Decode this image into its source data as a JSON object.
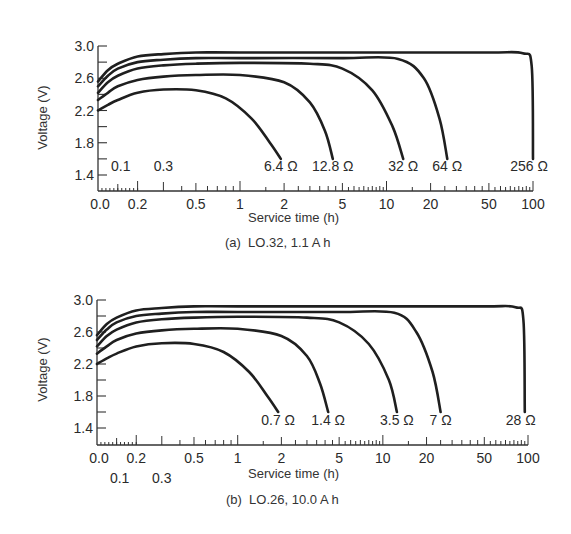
{
  "chart_data": [
    {
      "type": "line",
      "panel": "a",
      "caption": "(a)  LO.32, 1.1 A h",
      "xlabel": "Service time (h)",
      "ylabel": "Voltage (V)",
      "x_scale": "composite (linear 0–0.2, log 0.2–100)",
      "xlim": [
        0.0,
        100
      ],
      "ylim": [
        1.2,
        3.0
      ],
      "y_ticks": [
        3.0,
        2.6,
        2.2,
        1.8,
        1.4
      ],
      "y_tick_labels": [
        "3.0",
        "2.6",
        "2.2",
        "1.8",
        "1.4"
      ],
      "x_tick_labels": [
        "0.0",
        "0.2",
        "0.5",
        "1",
        "2",
        "5",
        "10",
        "20",
        "50",
        "100"
      ],
      "x_extra_labels": [
        "0.1",
        "0.3"
      ],
      "x_extra_labels_position": "inside-plot",
      "grid": false,
      "legend": "curve-end labels",
      "series": [
        {
          "name": "6.4 Ω",
          "x": [
            0.0,
            0.05,
            0.1,
            0.2,
            0.3,
            0.5,
            0.8,
            1.2,
            1.6,
            1.9
          ],
          "y": [
            2.2,
            2.27,
            2.33,
            2.42,
            2.46,
            2.45,
            2.35,
            2.1,
            1.8,
            1.6
          ]
        },
        {
          "name": "12.8 Ω",
          "x": [
            0.0,
            0.05,
            0.1,
            0.2,
            0.3,
            0.5,
            1.0,
            2.0,
            3.0,
            3.8,
            4.3
          ],
          "y": [
            2.33,
            2.42,
            2.5,
            2.58,
            2.62,
            2.64,
            2.64,
            2.55,
            2.3,
            1.95,
            1.6
          ]
        },
        {
          "name": "32 Ω",
          "x": [
            0.0,
            0.05,
            0.1,
            0.2,
            0.3,
            0.5,
            1.0,
            3.0,
            5.0,
            8.0,
            11.0,
            13.0
          ],
          "y": [
            2.42,
            2.55,
            2.63,
            2.72,
            2.76,
            2.78,
            2.79,
            2.78,
            2.72,
            2.45,
            2.0,
            1.6
          ]
        },
        {
          "name": "64 Ω",
          "x": [
            0.0,
            0.05,
            0.1,
            0.2,
            0.3,
            0.5,
            1.0,
            5.0,
            12.0,
            18.0,
            23.0,
            26.0
          ],
          "y": [
            2.5,
            2.63,
            2.72,
            2.8,
            2.83,
            2.85,
            2.85,
            2.85,
            2.84,
            2.6,
            2.1,
            1.6
          ]
        },
        {
          "name": "256 Ω",
          "x": [
            0.0,
            0.05,
            0.1,
            0.2,
            0.3,
            0.5,
            1.0,
            10.0,
            50.0,
            85.0,
            98.0,
            100.0
          ],
          "y": [
            2.56,
            2.7,
            2.78,
            2.87,
            2.9,
            2.92,
            2.92,
            2.92,
            2.92,
            2.91,
            2.75,
            1.6
          ]
        }
      ]
    },
    {
      "type": "line",
      "panel": "b",
      "caption": "(b)  LO.26, 10.0 A h",
      "xlabel": "Service time (h)",
      "ylabel": "Voltage (V)",
      "x_scale": "composite (linear 0–0.2, log 0.2–100)",
      "xlim": [
        0.0,
        100
      ],
      "ylim": [
        1.2,
        3.0
      ],
      "y_ticks": [
        3.0,
        2.6,
        2.2,
        1.8,
        1.4
      ],
      "y_tick_labels": [
        "3.0",
        "2.6",
        "2.2",
        "1.8",
        "1.4"
      ],
      "x_tick_labels": [
        "0.0",
        "0.2",
        "0.5",
        "1",
        "2",
        "5",
        "10",
        "20",
        "50",
        "100"
      ],
      "x_extra_labels": [
        "0.1",
        "0.3"
      ],
      "x_extra_labels_position": "below-axis",
      "grid": false,
      "legend": "curve-end labels",
      "series": [
        {
          "name": "0.7 Ω",
          "x": [
            0.0,
            0.05,
            0.1,
            0.2,
            0.3,
            0.5,
            0.8,
            1.2,
            1.6,
            1.9
          ],
          "y": [
            2.2,
            2.27,
            2.33,
            2.42,
            2.46,
            2.45,
            2.35,
            2.1,
            1.8,
            1.6
          ]
        },
        {
          "name": "1.4 Ω",
          "x": [
            0.0,
            0.05,
            0.1,
            0.2,
            0.3,
            0.5,
            1.0,
            2.0,
            3.0,
            3.7,
            4.2
          ],
          "y": [
            2.33,
            2.42,
            2.5,
            2.58,
            2.62,
            2.64,
            2.64,
            2.55,
            2.3,
            1.95,
            1.6
          ]
        },
        {
          "name": "3.5 Ω",
          "x": [
            0.0,
            0.05,
            0.1,
            0.2,
            0.3,
            0.5,
            1.0,
            3.0,
            5.0,
            8.0,
            11.0,
            12.5
          ],
          "y": [
            2.42,
            2.55,
            2.63,
            2.72,
            2.76,
            2.78,
            2.79,
            2.78,
            2.72,
            2.45,
            2.0,
            1.6
          ]
        },
        {
          "name": "7 Ω",
          "x": [
            0.0,
            0.05,
            0.1,
            0.2,
            0.3,
            0.5,
            1.0,
            5.0,
            12.0,
            17.0,
            22.0,
            25.0
          ],
          "y": [
            2.5,
            2.63,
            2.72,
            2.8,
            2.83,
            2.85,
            2.85,
            2.85,
            2.84,
            2.6,
            2.1,
            1.6
          ]
        },
        {
          "name": "28 Ω",
          "x": [
            0.0,
            0.05,
            0.1,
            0.2,
            0.3,
            0.5,
            1.0,
            10.0,
            50.0,
            82.0,
            93.0,
            95.0
          ],
          "y": [
            2.56,
            2.7,
            2.78,
            2.87,
            2.9,
            2.92,
            2.92,
            2.92,
            2.92,
            2.91,
            2.75,
            1.6
          ]
        }
      ]
    }
  ],
  "layout": {
    "panels": [
      {
        "x0": 98,
        "x1": 533,
        "y_top": 46,
        "y_14": 175,
        "y_base": 191,
        "xlabel_y": 217,
        "caption_y": 242
      },
      {
        "x0": 97,
        "x1": 528,
        "y_top": 300,
        "y_14": 428,
        "y_base": 445,
        "xlabel_y": 473,
        "caption_y": 500
      }
    ]
  }
}
